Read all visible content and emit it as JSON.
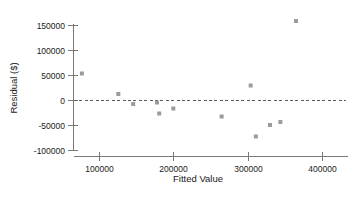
{
  "chart_data": {
    "type": "scatter",
    "title": "",
    "xlabel": "Fitted Value",
    "ylabel": "Residual ($)",
    "xlim": [
      60000,
      425000
    ],
    "ylim": [
      -110000,
      168000
    ],
    "xticks": [
      100000,
      200000,
      300000,
      400000
    ],
    "yticks": [
      -100000,
      -50000,
      0,
      50000,
      100000,
      150000
    ],
    "xticklabels": [
      "100000",
      "200000",
      "300000",
      "400000"
    ],
    "yticklabels": [
      "-100000",
      "-50000",
      "0",
      "50000",
      "100000",
      "150000"
    ],
    "grid": false,
    "legend": null,
    "reference_lines": [
      {
        "name": "zero-residual-line",
        "orientation": "horizontal",
        "value": 0,
        "style": "dashed",
        "color": "#5a5a5a"
      }
    ],
    "marker": {
      "shape": "square",
      "color": "#9b9b9b",
      "size": 4
    },
    "series": [
      {
        "name": "residuals",
        "points": [
          {
            "x": 77000,
            "y": 53000
          },
          {
            "x": 126000,
            "y": 12000
          },
          {
            "x": 146000,
            "y": -8000
          },
          {
            "x": 178000,
            "y": -5000
          },
          {
            "x": 181000,
            "y": -27000
          },
          {
            "x": 200000,
            "y": -17000
          },
          {
            "x": 265000,
            "y": -33000
          },
          {
            "x": 304000,
            "y": 29000
          },
          {
            "x": 311000,
            "y": -73000
          },
          {
            "x": 330000,
            "y": -50000
          },
          {
            "x": 344000,
            "y": -44000
          },
          {
            "x": 365000,
            "y": 158000
          }
        ]
      }
    ]
  },
  "axes": {
    "y_axis_title": "Residual ($)",
    "x_axis_title": "Fitted Value"
  },
  "colors": {
    "marker": "#9b9b9b",
    "axis": "#7a7a7a",
    "zero_line": "#5a5a5a",
    "text": "#1a1a1a",
    "background": "#ffffff"
  }
}
